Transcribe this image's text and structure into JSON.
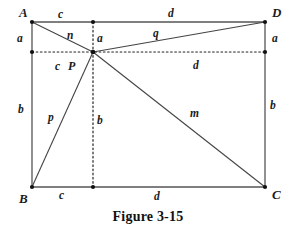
{
  "figure": {
    "caption": "Figure 3-15",
    "caption_x": 148,
    "caption_y": 209,
    "stroke_color": "#555555",
    "dot_color": "#111111",
    "background": "#ffffff",
    "geometry": {
      "A": {
        "x": 32,
        "y": 22
      },
      "B": {
        "x": 32,
        "y": 187
      },
      "C": {
        "x": 265,
        "y": 187
      },
      "D": {
        "x": 265,
        "y": 22
      },
      "P": {
        "x": 93,
        "y": 52
      },
      "foot_top": {
        "x": 93,
        "y": 22
      },
      "foot_bottom": {
        "x": 93,
        "y": 187
      },
      "foot_left": {
        "x": 32,
        "y": 52
      },
      "foot_right": {
        "x": 265,
        "y": 52
      }
    },
    "vertices": [
      {
        "name": "vertex-a",
        "text": "A",
        "x": 19,
        "y": 6
      },
      {
        "name": "vertex-b",
        "text": "B",
        "x": 19,
        "y": 192
      },
      {
        "name": "vertex-c",
        "text": "C",
        "x": 272,
        "y": 188
      },
      {
        "name": "vertex-d",
        "text": "D",
        "x": 272,
        "y": 6
      },
      {
        "name": "point-p",
        "text": "P",
        "x": 68,
        "y": 60
      }
    ],
    "segment_labels": [
      {
        "name": "label-top-left-c",
        "text": "c",
        "x": 58,
        "y": 9
      },
      {
        "name": "label-top-right-d",
        "text": "d",
        "x": 168,
        "y": 8
      },
      {
        "name": "label-left-upper-a",
        "text": "a",
        "x": 17,
        "y": 33
      },
      {
        "name": "label-right-upper-a",
        "text": "a",
        "x": 272,
        "y": 33
      },
      {
        "name": "label-center-upper-a",
        "text": "a",
        "x": 97,
        "y": 33
      },
      {
        "name": "label-diagonal-n",
        "text": "n",
        "x": 67,
        "y": 30
      },
      {
        "name": "label-diagonal-q",
        "text": "q",
        "x": 153,
        "y": 28
      },
      {
        "name": "label-mid-left-c",
        "text": "c",
        "x": 55,
        "y": 61
      },
      {
        "name": "label-mid-right-d",
        "text": "d",
        "x": 193,
        "y": 60
      },
      {
        "name": "label-left-lower-b",
        "text": "b",
        "x": 18,
        "y": 104
      },
      {
        "name": "label-right-lower-b",
        "text": "b",
        "x": 270,
        "y": 100
      },
      {
        "name": "label-center-lower-b",
        "text": "b",
        "x": 97,
        "y": 115
      },
      {
        "name": "label-diagonal-p",
        "text": "p",
        "x": 48,
        "y": 112
      },
      {
        "name": "label-diagonal-m",
        "text": "m",
        "x": 190,
        "y": 108
      },
      {
        "name": "label-bottom-left-c",
        "text": "c",
        "x": 59,
        "y": 190
      },
      {
        "name": "label-bottom-right-d",
        "text": "d",
        "x": 154,
        "y": 191
      }
    ]
  }
}
